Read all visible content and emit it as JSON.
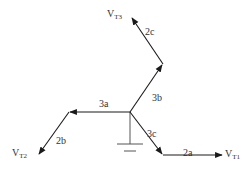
{
  "diagram": {
    "type": "phasor-diagram",
    "colors": {
      "line": "#1a1a1a",
      "ground": "#555555",
      "text": "#333333"
    },
    "origin": {
      "x": 130,
      "y": 112
    },
    "segments": [
      {
        "id": "3a",
        "label": "3a",
        "from": [
          130,
          112
        ],
        "to": [
          69,
          112
        ]
      },
      {
        "id": "2b",
        "label": "2b",
        "from": [
          69,
          112
        ],
        "to": [
          38,
          155
        ]
      },
      {
        "id": "3b",
        "label": "3b",
        "from": [
          130,
          112
        ],
        "to": [
          163,
          64
        ]
      },
      {
        "id": "2c",
        "label": "2c",
        "from": [
          163,
          64
        ],
        "to": [
          131,
          17
        ]
      },
      {
        "id": "3c",
        "label": "3c",
        "from": [
          130,
          112
        ],
        "to": [
          163,
          155
        ]
      },
      {
        "id": "2a",
        "label": "2a",
        "from": [
          163,
          155
        ],
        "to": [
          223,
          155
        ]
      }
    ],
    "terminals": {
      "vt1": {
        "main": "V",
        "sub": "T1"
      },
      "vt2": {
        "main": "V",
        "sub": "T2"
      },
      "vt3": {
        "main": "V",
        "sub": "T3"
      }
    },
    "segment_labels": {
      "l3a": "3a",
      "l2b": "2b",
      "l3b": "3b",
      "l2c": "2c",
      "l3c": "3c",
      "l2a": "2a"
    },
    "ground": {
      "x": 130,
      "top": 112,
      "bottom": 144
    }
  }
}
